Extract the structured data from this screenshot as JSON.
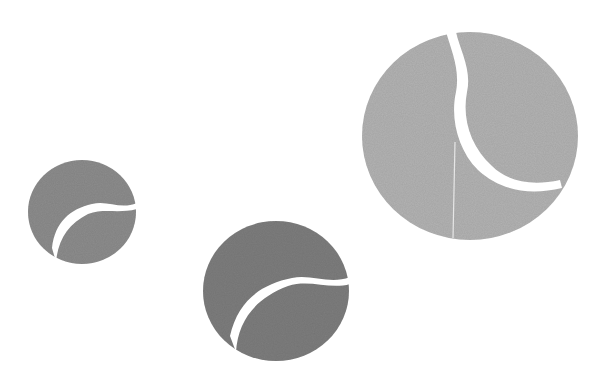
{
  "image": {
    "title": "Three tennis balls",
    "background": "#ffffff",
    "width": 598,
    "height": 382
  },
  "balls": [
    {
      "name": "small-tennis-ball",
      "cx": 82,
      "cy": 212,
      "rx": 54,
      "ry": 52,
      "fill": "#8d8d8d",
      "seam_color": "#ffffff",
      "seam_path": "M 137 203 C 120 210, 108 200, 92 204 C 70 209, 55 222, 52 248 L 56 262 C 58 240, 68 224, 88 214 C 104 208, 118 214, 137 209 Z"
    },
    {
      "name": "medium-tennis-ball",
      "cx": 276,
      "cy": 291,
      "rx": 73,
      "ry": 70,
      "fill": "#7e7e7e",
      "seam_color": "#ffffff",
      "seam_path": "M 350 277 C 330 285, 312 274, 292 278 C 262 284, 238 300, 230 336 L 236 352 C 238 320, 256 298, 288 286 C 310 279, 330 290, 350 284 Z"
    },
    {
      "name": "large-tennis-ball",
      "cx": 470,
      "cy": 136,
      "rx": 108,
      "ry": 104,
      "fill": "#b3b3b3",
      "seam_color": "#ffffff",
      "seam_path": "M 446 32 C 452 52, 460 70, 456 92 C 450 118, 458 150, 478 170 C 500 190, 528 196, 562 188 L 560 180 C 532 186, 508 182, 492 166 C 470 146, 462 118, 467 92 C 472 70, 460 50, 456 32 Z",
      "crease": {
        "x1": 455,
        "y1": 142,
        "x2": 453,
        "y2": 238,
        "color": "#e6e6e6"
      }
    }
  ]
}
